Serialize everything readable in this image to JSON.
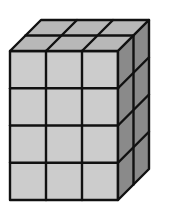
{
  "diagram": {
    "type": "isometric-cube-stack",
    "dimensions": {
      "width_cubes": 3,
      "depth_cubes": 2,
      "height_cubes": 4
    },
    "total_cubes": 24,
    "colors": {
      "front_face": "#cccccc",
      "top_face": "#b8b8b8",
      "side_face": "#8a8a8a",
      "edge": "#111111",
      "background": "#ffffff"
    }
  }
}
